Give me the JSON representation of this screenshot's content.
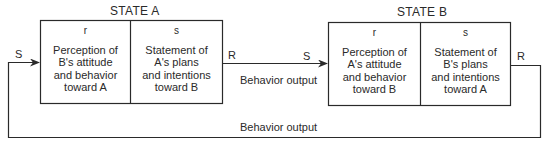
{
  "state_a": {
    "title": "STATE A",
    "r": {
      "letter": "r",
      "lines": [
        "Perception of",
        "B's attitude",
        "and behavior",
        "toward A"
      ]
    },
    "s": {
      "letter": "s",
      "lines": [
        "Statement of",
        "A's plans",
        "and intentions",
        "toward B"
      ]
    }
  },
  "state_b": {
    "title": "STATE B",
    "r": {
      "letter": "r",
      "lines": [
        "Perception of",
        "A's attitude",
        "and behavior",
        "toward B"
      ]
    },
    "s": {
      "letter": "s",
      "lines": [
        "Statement of",
        "B's plans",
        "and intentions",
        "toward A"
      ]
    }
  },
  "labels": {
    "s_left": "S",
    "r_a": "R",
    "s_b": "S",
    "r_b": "R",
    "middle_output": "Behavior output",
    "bottom_output": "Behavior output"
  },
  "colors": {
    "line": "#2a2a2a",
    "background": "#ffffff"
  }
}
